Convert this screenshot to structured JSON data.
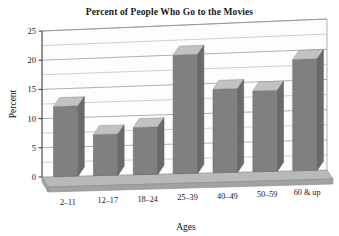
{
  "chart_data": {
    "type": "bar",
    "title": "Percent of People Who Go to the Movies",
    "xlabel": "Ages",
    "ylabel": "Percent",
    "categories": [
      "2–11",
      "12–17",
      "18–24",
      "25–39",
      "40–49",
      "50–59",
      "60 & up"
    ],
    "values": [
      12,
      7,
      8,
      20,
      14,
      13.5,
      18.5
    ],
    "ylim": [
      0,
      25
    ],
    "ytick_labels": [
      "0",
      "5",
      "10",
      "15",
      "20",
      "25"
    ],
    "ytick_values": [
      0,
      5,
      10,
      15,
      20,
      25
    ],
    "grid": true,
    "legend": null,
    "style": "3d-column",
    "colors": {
      "bar_front": "#808080",
      "bar_top": "#c2c2c2",
      "bar_side": "#6a6a6a",
      "floor": "#b8b8b8",
      "floor_front": "#a0a0a0",
      "wall": "#fdfdfd",
      "gridline": "#8e8e8e",
      "axis": "#3a3a3a",
      "text": "#151515",
      "background": "#ffffff"
    }
  }
}
